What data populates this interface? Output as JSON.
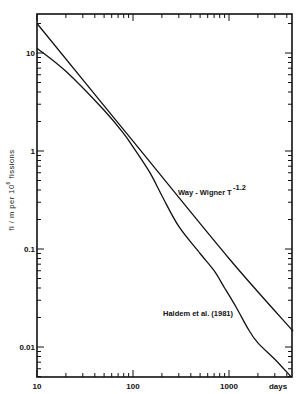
{
  "chart_data": {
    "type": "line",
    "title": "",
    "xlabel": "days",
    "ylabel": "fi/m per 10^6 fissions",
    "ylabel_parts": {
      "pre": "fi / m   per   10",
      "sup": "6",
      "post": "   fissions"
    },
    "xscale": "log",
    "yscale": "log",
    "xlim": [
      10,
      4650
    ],
    "ylim": [
      0.0047,
      25
    ],
    "grid": false,
    "legend": "none (inline annotations)",
    "x_tick_labels": [
      {
        "value": 10,
        "label": "10"
      },
      {
        "value": 100,
        "label": "100"
      },
      {
        "value": 1000,
        "label": "1000"
      }
    ],
    "x_end_label": "days",
    "y_tick_labels": [
      {
        "value": 10,
        "label": "10"
      },
      {
        "value": 1,
        "label": "1"
      },
      {
        "value": 0.1,
        "label": "0.1"
      },
      {
        "value": 0.01,
        "label": "0.01"
      }
    ],
    "series": [
      {
        "name": "Way-Wigner T^-1.2",
        "label_main": "Way - Wigner",
        "label_T": "T",
        "label_exp": "-1.2",
        "x": [
          10,
          100,
          1000,
          4650
        ],
        "values": [
          20,
          1.26,
          0.08,
          0.0145
        ]
      },
      {
        "name": "Haldem et al. (1981)",
        "label_main": "Haldem  et  al.  (1981)",
        "x": [
          10,
          20,
          50,
          80,
          100,
          150,
          200,
          300,
          500,
          700,
          900,
          1200,
          1600,
          2000,
          3000,
          4400
        ],
        "values": [
          11.2,
          6.5,
          2.6,
          1.5,
          1.1,
          0.6,
          0.35,
          0.17,
          0.09,
          0.06,
          0.04,
          0.025,
          0.015,
          0.011,
          0.0075,
          0.005
        ]
      }
    ],
    "annotations": [
      {
        "text": "Way - Wigner  T^-1.2",
        "near_x": 300,
        "near_y": 0.38
      },
      {
        "text": "Haldem et al. (1981)",
        "near_x": 200,
        "near_y": 0.023
      }
    ]
  }
}
